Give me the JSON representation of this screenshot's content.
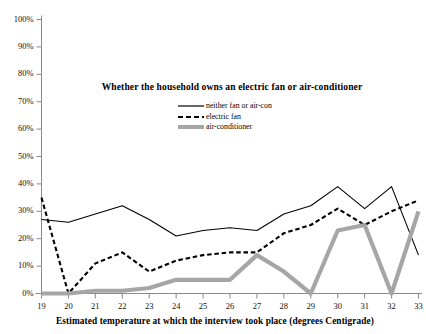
{
  "chart_data": {
    "type": "line",
    "title": "Whether the household owns an electric fan or air-conditioner",
    "xlabel": "Estimated temperature at which the interview took place (degrees Centigrade)",
    "ylabel": "",
    "x": [
      19,
      20,
      21,
      22,
      23,
      24,
      25,
      26,
      27,
      28,
      29,
      30,
      31,
      32,
      33
    ],
    "xlim": [
      18.5,
      33.5
    ],
    "ylim": [
      0,
      100
    ],
    "ytick_labels": [
      "0%",
      "10%",
      "20%",
      "30%",
      "40%",
      "50%",
      "60%",
      "70%",
      "80%",
      "90%",
      "100%"
    ],
    "ytick_values": [
      0,
      10,
      20,
      30,
      40,
      50,
      60,
      70,
      80,
      90,
      100
    ],
    "xtick_labels": [
      "19",
      "20",
      "21",
      "22",
      "23",
      "24",
      "25",
      "26",
      "27",
      "28",
      "29",
      "30",
      "31",
      "32",
      "33"
    ],
    "grid": false,
    "legend_position": "upper center inside",
    "series": [
      {
        "name": "neither fan or air-con",
        "style": "solid",
        "color": "#000000",
        "values": [
          27,
          26,
          29,
          32,
          27,
          21,
          23,
          24,
          23,
          29,
          32,
          39,
          31,
          39,
          14
        ]
      },
      {
        "name": "electric fan",
        "style": "dashed",
        "color": "#000000",
        "values": [
          35,
          0,
          11,
          15,
          8,
          12,
          14,
          15,
          15,
          22,
          25,
          31,
          25,
          30,
          34
        ]
      },
      {
        "name": "air-conditioner",
        "style": "thick-solid",
        "color": "#a6a6a6",
        "values": [
          0,
          0,
          1,
          1,
          2,
          5,
          5,
          5,
          14,
          8,
          0,
          23,
          25,
          0,
          30
        ]
      }
    ]
  },
  "legend": {
    "items": [
      {
        "label": "neither fan or air-con",
        "icon": "solid-line-icon"
      },
      {
        "label": "electric fan",
        "icon": "dashed-line-icon"
      },
      {
        "label": "air-conditioner",
        "icon": "thick-grey-line-icon"
      }
    ]
  },
  "colors": {
    "axis": "#8a8a8a",
    "line_black": "#000000",
    "line_grey": "#a6a6a6",
    "background": "#ffffff",
    "text": "#000000"
  }
}
